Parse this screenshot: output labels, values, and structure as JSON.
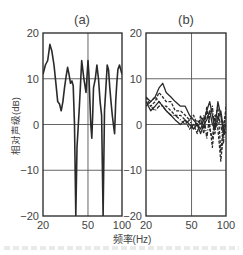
{
  "chart_data": [
    {
      "type": "line",
      "panel_label": "(a)",
      "xlabel": "频率(Hz)",
      "ylabel": "相对声级(dB)",
      "x_scale": "log",
      "xlim": [
        20,
        100
      ],
      "ylim": [
        -20,
        20
      ],
      "xticks": [
        20,
        50,
        100
      ],
      "yticks": [
        20,
        10,
        0,
        -10,
        -20
      ],
      "grid": true,
      "series": [
        {
          "name": "single response",
          "style": "solid",
          "x": [
            20,
            21,
            22,
            23,
            24,
            25,
            26,
            27,
            28,
            29,
            30,
            31,
            32,
            33,
            34,
            35,
            36,
            37,
            38,
            39,
            40,
            42,
            44,
            46,
            48,
            50,
            51,
            52,
            53,
            54,
            55,
            56,
            58,
            60,
            62,
            64,
            66,
            68,
            70,
            72,
            74,
            76,
            78,
            80,
            82,
            84,
            86,
            88,
            90,
            92,
            95,
            100
          ],
          "y": [
            11,
            13,
            14,
            17.5,
            16,
            13,
            9,
            5,
            4.5,
            3,
            5,
            8,
            10.5,
            12.5,
            11,
            9,
            9.5,
            8.5,
            0,
            -25,
            -5,
            4,
            14,
            10,
            7,
            14,
            11,
            5,
            0,
            -3,
            2,
            8,
            10,
            13,
            10,
            5,
            2,
            -20,
            3,
            8,
            13,
            12,
            8,
            5,
            2,
            0,
            -2,
            5,
            9,
            12,
            13,
            11
          ]
        }
      ]
    },
    {
      "type": "line",
      "panel_label": "(b)",
      "xlabel": "频率(Hz)",
      "ylabel": "",
      "x_scale": "log",
      "xlim": [
        20,
        100
      ],
      "ylim": [
        -20,
        20
      ],
      "xticks": [
        20,
        50,
        100
      ],
      "yticks": [
        20,
        10,
        0,
        -10,
        -20
      ],
      "grid": true,
      "series": [
        {
          "name": "response 1",
          "style": "solid",
          "x": [
            20,
            22,
            24,
            26,
            28,
            30,
            33,
            36,
            40,
            44,
            48,
            52,
            56,
            60,
            64,
            68,
            72,
            76,
            80,
            85,
            90,
            95,
            100
          ],
          "y": [
            6,
            5,
            6,
            8,
            9,
            7,
            6,
            5,
            4,
            4,
            2,
            1,
            0,
            -1,
            1,
            3,
            5,
            2,
            -1,
            5,
            2,
            -2,
            0
          ]
        },
        {
          "name": "response 2",
          "style": "solid",
          "x": [
            20,
            22,
            24,
            26,
            28,
            30,
            33,
            36,
            40,
            44,
            48,
            52,
            56,
            60,
            64,
            68,
            72,
            76,
            80,
            85,
            90,
            95,
            100
          ],
          "y": [
            5,
            3,
            4,
            5,
            4,
            3,
            2,
            1,
            0,
            1,
            0,
            -1,
            0,
            -2,
            0,
            1,
            3,
            0,
            -1,
            1,
            3,
            -1,
            -2
          ]
        },
        {
          "name": "response 3",
          "style": "dashed",
          "x": [
            20,
            22,
            24,
            26,
            28,
            30,
            33,
            36,
            40,
            44,
            48,
            52,
            56,
            60,
            64,
            68,
            72,
            76,
            80,
            85,
            90,
            95,
            100
          ],
          "y": [
            4,
            5,
            6,
            5,
            4,
            4,
            3,
            2,
            2,
            1,
            -1,
            0,
            -2,
            2,
            -1,
            3,
            0,
            -5,
            1,
            4,
            -6,
            0,
            3
          ]
        },
        {
          "name": "response 4",
          "style": "dashed",
          "x": [
            20,
            22,
            24,
            26,
            28,
            30,
            33,
            36,
            40,
            44,
            48,
            52,
            56,
            60,
            64,
            68,
            72,
            76,
            80,
            85,
            90,
            95,
            100
          ],
          "y": [
            6,
            4,
            5,
            7,
            6,
            5,
            5,
            3,
            3,
            2,
            1,
            2,
            0,
            1,
            -2,
            4,
            -1,
            -3,
            2,
            -1,
            -8,
            -2,
            4
          ]
        },
        {
          "name": "response 5",
          "style": "dashdot",
          "x": [
            20,
            22,
            24,
            26,
            28,
            30,
            33,
            36,
            40,
            44,
            48,
            52,
            56,
            60,
            64,
            68,
            72,
            76,
            80,
            85,
            90,
            95,
            100
          ],
          "y": [
            5,
            4,
            3,
            4,
            4,
            3,
            2,
            2,
            1,
            0,
            1,
            -1,
            1,
            0,
            2,
            -3,
            2,
            4,
            -2,
            2,
            0,
            -4,
            2
          ]
        }
      ]
    }
  ],
  "figure": {
    "panels": [
      "(a)",
      "(b)"
    ],
    "xlabel": "频率(Hz)",
    "ylabel": "相对声级(dB)",
    "ytick_labels": [
      "20",
      "10",
      "0",
      "-10",
      "-20"
    ],
    "xtick_labels": [
      "20",
      "50",
      "100"
    ]
  }
}
